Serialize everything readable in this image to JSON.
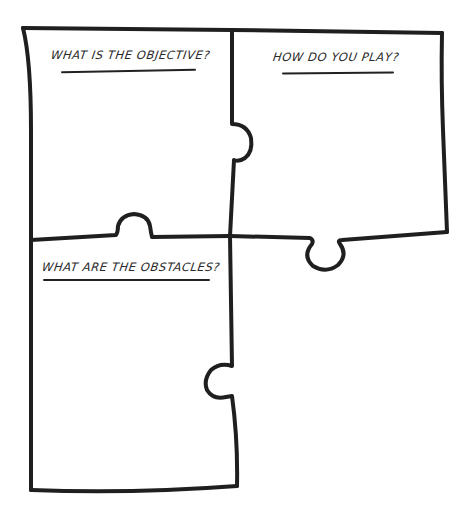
{
  "diagram": {
    "type": "puzzle-pieces-worksheet",
    "colors": {
      "stroke": "#1f1f1f",
      "background": "#ffffff",
      "text": "#2a2a2a"
    },
    "pieces": [
      {
        "id": "top-left",
        "prompt": "WHAT IS THE OBJECTIVE?"
      },
      {
        "id": "top-right",
        "prompt": "HOW DO YOU PLAY?"
      },
      {
        "id": "bottom-left",
        "prompt": "WHAT ARE THE OBSTACLES?"
      }
    ]
  }
}
